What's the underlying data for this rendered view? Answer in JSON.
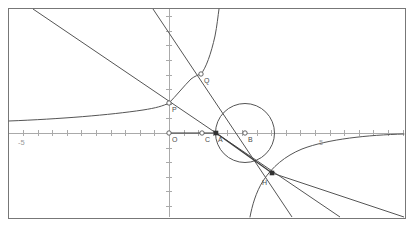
{
  "figure": {
    "frame": {
      "x": 8,
      "y": 8,
      "width": 397,
      "height": 210,
      "stroke": "#777777"
    },
    "background": "#ffffff",
    "curve_color": "#555555",
    "axis_color": "#aaaaaa",
    "label_color": "#4a4a4a",
    "tick_label_color": "#9a9a9a"
  },
  "axes": {
    "origin_px": {
      "x": 169,
      "y": 133
    },
    "unit_px": 14.6,
    "x_axis": {
      "y_px": 133,
      "x_start_px": 9,
      "x_end_px": 404
    },
    "y_axis": {
      "x_px": 169,
      "y_start_px": 9,
      "y_end_px": 217
    },
    "tick_half_px": 3,
    "tick_labels": [
      {
        "text": "-5",
        "x_px": 18,
        "y_px": 139
      },
      {
        "text": "5",
        "x_px": 319,
        "y_px": 139
      }
    ]
  },
  "points": [
    {
      "name": "O",
      "marker": "open-circle",
      "cx": 169,
      "cy": 133,
      "label": "O",
      "lx": 172,
      "ly": 136
    },
    {
      "name": "C",
      "marker": "open-circle",
      "cx": 202,
      "cy": 133,
      "label": "C",
      "lx": 205,
      "ly": 136
    },
    {
      "name": "A",
      "marker": "filled-square",
      "cx": 216,
      "cy": 133,
      "label": "A",
      "lx": 218,
      "ly": 136
    },
    {
      "name": "B",
      "marker": "open-circle",
      "cx": 245,
      "cy": 133,
      "label": "B",
      "lx": 248,
      "ly": 136
    },
    {
      "name": "P",
      "marker": "open-circle",
      "cx": 169,
      "cy": 103,
      "label": "P",
      "lx": 172,
      "ly": 106
    },
    {
      "name": "Q",
      "marker": "open-circle",
      "cx": 201,
      "cy": 74,
      "label": "Q",
      "lx": 204,
      "ly": 77
    },
    {
      "name": "H",
      "marker": "filled-square",
      "cx": 272,
      "cy": 173,
      "label": "H",
      "lx": 262,
      "ly": 179
    }
  ],
  "circle": {
    "name": "circle-centered-at-B",
    "cx": 245,
    "cy": 133,
    "r": 29.5
  },
  "segments": [
    {
      "name": "segment-O-A",
      "x1": 169,
      "y1": 133,
      "x2": 216,
      "y2": 133
    },
    {
      "name": "segment-A-H",
      "x1": 216,
      "y1": 133,
      "x2": 272,
      "y2": 173
    }
  ],
  "lines": [
    {
      "name": "line-through-P-and-H",
      "x1": 33,
      "y1": 9,
      "x2": 340,
      "y2": 217
    },
    {
      "name": "line-through-Q-and-H",
      "x1": 153,
      "y1": 9,
      "x2": 292,
      "y2": 217
    },
    {
      "name": "line-H-to-bottom",
      "x1": 272,
      "y1": 173,
      "x2": 404,
      "y2": 217
    }
  ],
  "hyperbola": {
    "name": "hyperbola-two-branches",
    "upper_left_branch": "passes through P at (169,103), asymptotic toward lower-left, flattening near y=120 at far left",
    "upper_right_branch": "steep branch descending from top edge near x=218 to vertex near Q (201,74) then rising",
    "lower_right_branch": "passes from bottom edge near x=250 up through H region, flattening toward right edge near y=141"
  },
  "chart_data": {
    "type": "scatter",
    "xlabel": "",
    "ylabel": "",
    "xlim": [
      -11,
      16.1
    ],
    "ylim": [
      -5.8,
      8.5
    ],
    "grid": false,
    "legend": null,
    "tick_labels_x": [
      "-5",
      "5"
    ],
    "points": [
      {
        "label": "O",
        "x": 0.0,
        "y": 0.0
      },
      {
        "label": "C",
        "x": 2.3,
        "y": 0.0
      },
      {
        "label": "A",
        "x": 3.2,
        "y": 0.0
      },
      {
        "label": "B",
        "x": 5.2,
        "y": 0.0
      },
      {
        "label": "P",
        "x": 0.0,
        "y": 2.1
      },
      {
        "label": "Q",
        "x": 2.2,
        "y": 4.0
      },
      {
        "label": "H",
        "x": 7.1,
        "y": -2.7
      }
    ],
    "circle": {
      "center_label": "B",
      "cx": 5.2,
      "cy": 0.0,
      "r": 2.0
    },
    "series": [
      {
        "name": "hyperbola",
        "type": "curve"
      },
      {
        "name": "line-P-H",
        "type": "line"
      },
      {
        "name": "line-Q-H",
        "type": "line"
      },
      {
        "name": "segment-O-A",
        "type": "segment"
      },
      {
        "name": "segment-A-H",
        "type": "segment"
      }
    ]
  }
}
